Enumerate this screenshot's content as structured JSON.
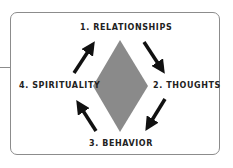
{
  "diagram": {
    "type": "cycle",
    "nodes": [
      {
        "id": 1,
        "label": "1. RELATIONSHIPS",
        "position": "top"
      },
      {
        "id": 2,
        "label": "2. THOUGHTS",
        "position": "right"
      },
      {
        "id": 3,
        "label": "3. BEHAVIOR",
        "position": "bottom"
      },
      {
        "id": 4,
        "label": "4. SPIRITUALITY",
        "position": "left"
      }
    ],
    "edges": [
      {
        "from": 1,
        "to": 2,
        "icon": "arrow-down-right-icon"
      },
      {
        "from": 2,
        "to": 3,
        "icon": "arrow-down-left-icon"
      },
      {
        "from": 3,
        "to": 4,
        "icon": "arrow-up-left-icon"
      },
      {
        "from": 4,
        "to": 1,
        "icon": "arrow-up-right-icon"
      }
    ],
    "center_shape": "diamond",
    "colors": {
      "diamond": "#8a8a8a",
      "arrows": "#111111",
      "border": "#8c8c8c",
      "text": "#222222"
    }
  }
}
